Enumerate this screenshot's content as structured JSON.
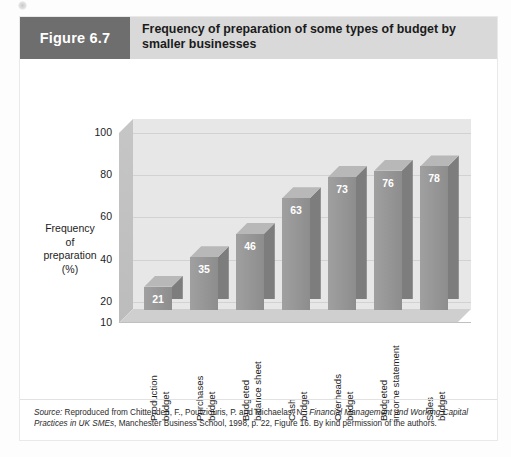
{
  "figure": {
    "badge_label": "Figure 6.7",
    "title": "Frequency of preparation of some types of budget by smaller businesses"
  },
  "colors": {
    "header_bg": "#d9d9d9",
    "badge_bg": "#6e6e6e",
    "bar_front": "#8d8d8d",
    "bar_top": "#b8b8b8",
    "bar_side": "#7d7d7d",
    "plot_bg": "#e7e7e7",
    "gridline": "#d2d2d2"
  },
  "chart_data": {
    "type": "bar",
    "title": "Frequency of preparation of some types of budget by smaller businesses",
    "xlabel": "",
    "ylabel": "Frequency of preparation (%)",
    "ylim": [
      10,
      100
    ],
    "yticks": [
      100,
      80,
      60,
      40,
      20,
      10
    ],
    "grid": true,
    "legend": "none",
    "three_d": true,
    "categories": [
      "Production budget",
      "Purchases budget",
      "Budgeted balance sheet",
      "Cash budget",
      "Overheads budget",
      "Budgeted income statement",
      "Sales budget"
    ],
    "category_lines": [
      [
        "Production",
        "budget"
      ],
      [
        "Purchases",
        "budget"
      ],
      [
        "Budgeted",
        "balance sheet"
      ],
      [
        "Cash",
        "budget"
      ],
      [
        "Overheads",
        "budget"
      ],
      [
        "Budgeted",
        "income statement"
      ],
      [
        "Sales",
        "budget"
      ]
    ],
    "values": [
      21,
      35,
      46,
      63,
      73,
      76,
      78
    ]
  },
  "axis": {
    "y_title_lines": [
      "Frequency",
      "of",
      "preparation",
      "(%)"
    ]
  },
  "source": {
    "label": "Source:",
    "text_1": " Reproduced from Chittenden, F., Poutziouris, P. and Michaelas, N., ",
    "italic_title": "Financial Management and Working Capital Practices in UK SMEs",
    "text_2": ", Manchester Business School, 1998, p. 22, Figure 16. By kind permission of the authors."
  }
}
